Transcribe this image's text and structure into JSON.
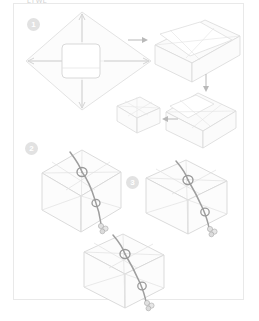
{
  "document": {
    "kind": "instructional-diagram",
    "subject": "cloth gift wrapping (furoshiki) step sequence",
    "top_caption": "LTWL",
    "background_color": "#ffffff",
    "frame_color": "#e9e9e9",
    "line_color": "#d8d8d8",
    "fill_color": "#fbfbfb",
    "cord_color": "#9b9b9b",
    "badge_color": "#e2e2e2",
    "badge_text_color": "#ffffff",
    "arrow_color": "#b9b9b9"
  },
  "steps": [
    {
      "number": "1",
      "label": "step-1",
      "description": "flat square cloth laid as a diamond with a box centered on it; arrows point outward to the four corners"
    },
    {
      "number": "2",
      "label": "step-2",
      "description": "wrapped box tied with a knotted cord on top, viewed in three-quarter perspective"
    },
    {
      "number": "3",
      "label": "step-3",
      "description": "finished wrapped box with cord knot and hanging tassel ends"
    }
  ],
  "figures": [
    {
      "name": "flat-cloth-with-box",
      "step": "1"
    },
    {
      "name": "cloth-folding-over-box",
      "step": "1"
    },
    {
      "name": "corner-tucked-box",
      "step": "1"
    },
    {
      "name": "small-wrapped-parcel",
      "step": "1"
    },
    {
      "name": "tied-box-with-knot",
      "step": "2"
    },
    {
      "name": "tied-box-with-tassel",
      "step": "3"
    },
    {
      "name": "finished-wrapped-box",
      "step": "3"
    }
  ],
  "arrows": [
    {
      "name": "arrow-right-step1",
      "direction": "right"
    },
    {
      "name": "arrow-down-step1",
      "direction": "down"
    },
    {
      "name": "arrow-left-step1",
      "direction": "left"
    }
  ]
}
